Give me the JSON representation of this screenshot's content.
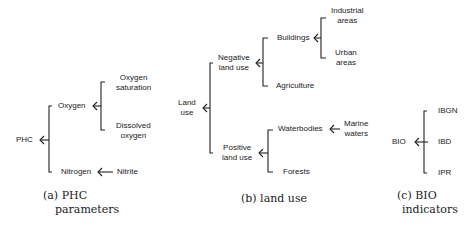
{
  "panels": [
    {
      "id": "a",
      "caption_line1": "(a) PHC",
      "caption_line2": "parameters",
      "root": "PHC",
      "nodes": {
        "oxygen": "Oxygen",
        "oxygen_saturation_1": "Oxygen",
        "oxygen_saturation_2": "saturation",
        "dissolved_oxygen_1": "Dissolved",
        "dissolved_oxygen_2": "oxygen",
        "nitrogen": "Nitrogen",
        "nitrite": "Nitrite"
      }
    },
    {
      "id": "b",
      "caption": "(b) land use",
      "root_1": "Land",
      "root_2": "use",
      "nodes": {
        "negative_1": "Negative",
        "negative_2": "land use",
        "buildings": "Buildings",
        "industrial_1": "Industrial",
        "industrial_2": "areas",
        "urban_1": "Urban",
        "urban_2": "areas",
        "agriculture": "Agriculture",
        "positive_1": "Positive",
        "positive_2": "land use",
        "waterbodies": "Waterbodies",
        "marine_1": "Marine",
        "marine_2": "waters",
        "forests": "Forests"
      }
    },
    {
      "id": "c",
      "caption_line1": "(c) BIO",
      "caption_line2": "indicators",
      "root": "BIO",
      "nodes": {
        "ibgn": "IBGN",
        "ibd": "IBD",
        "ipr": "IPR"
      }
    }
  ]
}
